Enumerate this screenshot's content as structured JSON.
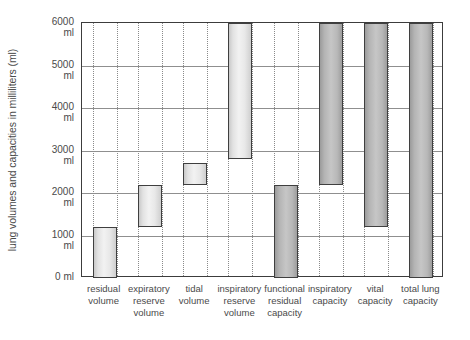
{
  "chart_data": {
    "type": "bar",
    "title": "",
    "subtitle": "",
    "xlabel": "",
    "ylabel": "lung volumes and capacities in milliliters (ml)",
    "ylim": [
      0,
      6000
    ],
    "ytick_values": [
      0,
      1000,
      2000,
      3000,
      4000,
      5000,
      6000
    ],
    "ytick_labels": [
      "0 ml",
      "1000 ml",
      "2000 ml",
      "3000 ml",
      "4000 ml",
      "5000 ml",
      "6000 ml"
    ],
    "ytick_numbers": [
      "0",
      "1000",
      "2000",
      "3000",
      "4000",
      "5000",
      "6000"
    ],
    "ytick_unit": "ml",
    "grid": true,
    "legend": "none",
    "note": "Floating bars: each bar spans from a low value to a high value.",
    "categories": [
      "residual volume",
      "expiratory reserve volume",
      "tidal volume",
      "inspiratory reserve volume",
      "functional residual capacity",
      "inspiratory capacity",
      "vital capacity",
      "total lung capacity"
    ],
    "category_lines": [
      [
        "residual",
        "volume"
      ],
      [
        "expiratory",
        "reserve",
        "volume"
      ],
      [
        "tidal",
        "volume"
      ],
      [
        "inspiratory",
        "reserve",
        "volume"
      ],
      [
        "functional",
        "residual",
        "capacity"
      ],
      [
        "inspiratory",
        "capacity"
      ],
      [
        "vital",
        "capacity"
      ],
      [
        "total lung",
        "capacity"
      ]
    ],
    "bars": [
      {
        "label": "residual volume",
        "low": 0,
        "high": 1200,
        "span": 1200,
        "shade": "light"
      },
      {
        "label": "expiratory reserve volume",
        "low": 1200,
        "high": 2200,
        "span": 1000,
        "shade": "light"
      },
      {
        "label": "tidal volume",
        "low": 2200,
        "high": 2700,
        "span": 500,
        "shade": "light"
      },
      {
        "label": "inspiratory reserve volume",
        "low": 2800,
        "high": 6000,
        "span": 3200,
        "shade": "light"
      },
      {
        "label": "functional residual capacity",
        "low": 0,
        "high": 2200,
        "span": 2200,
        "shade": "dark"
      },
      {
        "label": "inspiratory capacity",
        "low": 2200,
        "high": 6000,
        "span": 3800,
        "shade": "dark"
      },
      {
        "label": "vital capacity",
        "low": 1200,
        "high": 6000,
        "span": 4800,
        "shade": "dark"
      },
      {
        "label": "total lung capacity",
        "low": 0,
        "high": 6000,
        "span": 6000,
        "shade": "dark"
      }
    ],
    "colors": {
      "axis": "#3c3c3c",
      "gridline": "#8f8f8f",
      "guide": "#8a8a8a",
      "bar_light": "#eeeeee",
      "bar_dark": "#b6b6b6",
      "text": "#4a4a4a",
      "background": "#ffffff"
    }
  }
}
